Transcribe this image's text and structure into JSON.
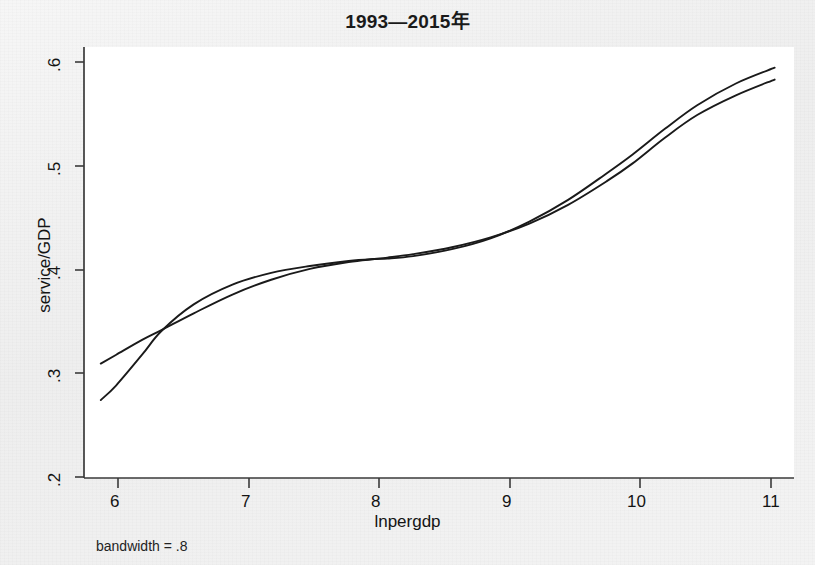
{
  "figure": {
    "title": "1993—2015年",
    "footnote": "bandwidth = .8",
    "background_color": "#f1f1f1",
    "plot_background_color": "#ffffff",
    "line_color": "#1a1a1a",
    "axis_color": "#3a3a3a"
  },
  "axes": {
    "x_title": "lnpergdp",
    "y_title": "service/GDP",
    "x_ticks": [
      "6",
      "7",
      "8",
      "9",
      "10",
      "11"
    ],
    "y_ticks": [
      ".2",
      ".3",
      ".4",
      ".5",
      ".6"
    ]
  },
  "chart_data": {
    "type": "line",
    "title": "1993—2015年",
    "xlabel": "lnpergdp",
    "ylabel": "service/GDP",
    "xlim": [
      5.75,
      11.25
    ],
    "ylim": [
      0.178,
      0.615
    ],
    "x_ticks": [
      6,
      7,
      8,
      9,
      10,
      11
    ],
    "y_ticks": [
      0.2,
      0.3,
      0.4,
      0.5,
      0.6
    ],
    "grid": false,
    "legend": "none",
    "annotations": [
      "bandwidth = .8"
    ],
    "series": [
      {
        "name": "lowess smooth",
        "comment": "starts lower and steeper at the left, crosses the other curve near lnpergdp 6.35 and again near 10.25",
        "x": [
          5.88,
          6.0,
          6.2,
          6.35,
          6.6,
          6.9,
          7.2,
          7.5,
          7.8,
          8.0,
          8.1,
          8.3,
          8.6,
          8.9,
          9.2,
          9.5,
          9.8,
          10.0,
          10.25,
          10.5,
          10.8,
          11.1
        ],
        "y": [
          0.257,
          0.272,
          0.303,
          0.327,
          0.354,
          0.374,
          0.386,
          0.393,
          0.398,
          0.4,
          0.4005,
          0.403,
          0.41,
          0.421,
          0.438,
          0.46,
          0.487,
          0.506,
          0.532,
          0.556,
          0.578,
          0.594
        ]
      },
      {
        "name": "polynomial fit",
        "comment": "starts higher and flatter at the left, ends slightly below the other curve",
        "x": [
          5.88,
          6.0,
          6.2,
          6.35,
          6.6,
          6.9,
          7.2,
          7.5,
          7.8,
          8.0,
          8.1,
          8.3,
          8.6,
          8.9,
          9.2,
          9.5,
          9.8,
          10.0,
          10.25,
          10.5,
          10.8,
          11.1
        ],
        "y": [
          0.294,
          0.303,
          0.318,
          0.328,
          0.345,
          0.364,
          0.379,
          0.39,
          0.397,
          0.4,
          0.4015,
          0.405,
          0.412,
          0.422,
          0.436,
          0.455,
          0.479,
          0.497,
          0.523,
          0.546,
          0.566,
          0.582
        ]
      }
    ]
  }
}
